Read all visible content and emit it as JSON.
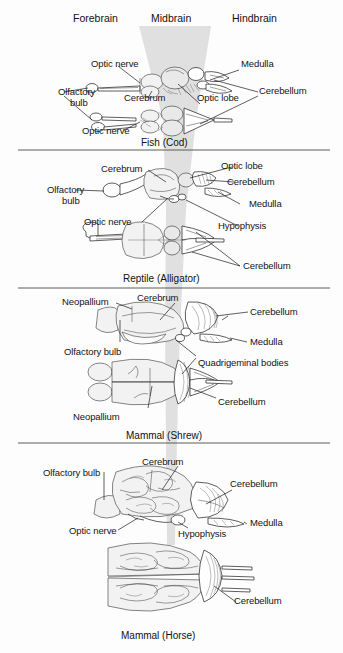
{
  "figure": {
    "header": {
      "forebrain": "Forebrain",
      "midbrain": "Midbrain",
      "hindbrain": "Hindbrain"
    },
    "band": {
      "name": "midbrain-band",
      "color": "#cfcfcf"
    },
    "panels": [
      {
        "id": "fish",
        "caption": "Fish (Cod)",
        "views": [
          "lateral",
          "dorsal"
        ],
        "labels": [
          {
            "text": "Optic nerve",
            "id": "fish-optic-nerve-top"
          },
          {
            "text": "Olfactory",
            "id": "fish-olfactory-bulb-line1"
          },
          {
            "text": "bulb",
            "id": "fish-olfactory-bulb-line2"
          },
          {
            "text": "Cerebrum",
            "id": "fish-cerebrum"
          },
          {
            "text": "Optic lobe",
            "id": "fish-optic-lobe"
          },
          {
            "text": "Optic nerve",
            "id": "fish-optic-nerve-bottom"
          },
          {
            "text": "Medulla",
            "id": "fish-medulla"
          },
          {
            "text": "Cerebellum",
            "id": "fish-cerebellum"
          }
        ]
      },
      {
        "id": "reptile",
        "caption": "Reptile (Alligator)",
        "views": [
          "lateral",
          "dorsal"
        ],
        "labels": [
          {
            "text": "Cerebrum",
            "id": "reptile-cerebrum"
          },
          {
            "text": "Olfactory",
            "id": "reptile-olfactory-bulb-line1"
          },
          {
            "text": "bulb",
            "id": "reptile-olfactory-bulb-line2"
          },
          {
            "text": "Optic nerve",
            "id": "reptile-optic-nerve"
          },
          {
            "text": "Optic lobe",
            "id": "reptile-optic-lobe"
          },
          {
            "text": "Cerebellum",
            "id": "reptile-cerebellum-top"
          },
          {
            "text": "Medulla",
            "id": "reptile-medulla"
          },
          {
            "text": "Hypophysis",
            "id": "reptile-hypophysis"
          },
          {
            "text": "Cerebellum",
            "id": "reptile-cerebellum-bottom"
          }
        ]
      },
      {
        "id": "shrew",
        "caption": "Mammal (Shrew)",
        "views": [
          "lateral",
          "dorsal"
        ],
        "labels": [
          {
            "text": "Neopallium",
            "id": "shrew-neopallium-top"
          },
          {
            "text": "Cerebrum",
            "id": "shrew-cerebrum"
          },
          {
            "text": "Cerebellum",
            "id": "shrew-cerebellum-top"
          },
          {
            "text": "Medulla",
            "id": "shrew-medulla"
          },
          {
            "text": "Olfactory bulb",
            "id": "shrew-olfactory-bulb"
          },
          {
            "text": "Quadrigeminal bodies",
            "id": "shrew-quadrigeminal-bodies"
          },
          {
            "text": "Neopallium",
            "id": "shrew-neopallium-bottom"
          },
          {
            "text": "Cerebellum",
            "id": "shrew-cerebellum-bottom"
          }
        ]
      },
      {
        "id": "horse",
        "caption": "Mammal (Horse)",
        "views": [
          "lateral",
          "dorsal"
        ],
        "labels": [
          {
            "text": "Olfactory bulb",
            "id": "horse-olfactory-bulb"
          },
          {
            "text": "Cerebrum",
            "id": "horse-cerebrum"
          },
          {
            "text": "Cerebellum",
            "id": "horse-cerebellum-top"
          },
          {
            "text": "Medulla",
            "id": "horse-medulla"
          },
          {
            "text": "Optic nerve",
            "id": "horse-optic-nerve"
          },
          {
            "text": "Hypophysis",
            "id": "horse-hypophysis"
          },
          {
            "text": "Cerebellum",
            "id": "horse-cerebellum-bottom"
          }
        ]
      }
    ]
  }
}
